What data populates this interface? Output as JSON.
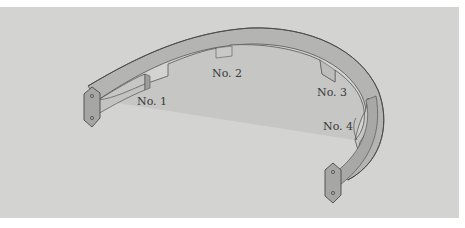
{
  "diagram": {
    "background_color": "#d3d3d2",
    "part_top_color": "#a9a9a9",
    "part_side_color": "#bdbdbd",
    "outline_color": "#555555",
    "labels": [
      {
        "id": "no1",
        "text": "No. 1"
      },
      {
        "id": "no2",
        "text": "No. 2"
      },
      {
        "id": "no3",
        "text": "No. 3"
      },
      {
        "id": "no4",
        "text": "No. 4"
      }
    ],
    "end_caps": [
      {
        "id": "left",
        "holes": 2
      },
      {
        "id": "right",
        "holes": 2
      }
    ]
  }
}
